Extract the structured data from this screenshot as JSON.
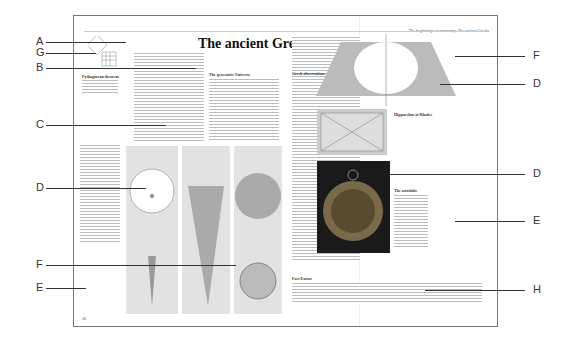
{
  "page": {
    "title": "The ancient Greeks",
    "running_header": "The beginnings of astronomy: The ancient Greeks",
    "section_1": "The geocentric Universe",
    "section_2": "Greek observations",
    "fact_heading": "Fact Extras",
    "caption_pythagoras": "Pythagorean theorem",
    "caption_heraclides": "Heraclides",
    "caption_hipparchus": "Hipparchus at Rhodes",
    "caption_astrolabe": "The astrolabe",
    "page_number": "56"
  },
  "callouts_left": [
    {
      "label": "A",
      "y": 42
    },
    {
      "label": "G",
      "y": 53
    },
    {
      "label": "B",
      "y": 68
    },
    {
      "label": "C",
      "y": 125
    },
    {
      "label": "D",
      "y": 188
    },
    {
      "label": "F",
      "y": 265
    },
    {
      "label": "E",
      "y": 288
    }
  ],
  "callouts_right": [
    {
      "label": "F",
      "y": 56
    },
    {
      "label": "D",
      "y": 84
    },
    {
      "label": "D",
      "y": 174
    },
    {
      "label": "E",
      "y": 221
    },
    {
      "label": "H",
      "y": 290
    }
  ]
}
